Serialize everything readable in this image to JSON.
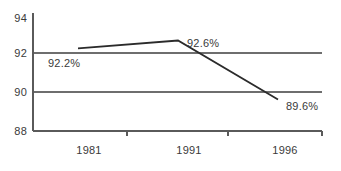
{
  "chart_data": {
    "type": "line",
    "title": "",
    "subtitle": "",
    "xlabel": "",
    "ylabel": "",
    "categories": [
      "1981",
      "1991",
      "1996"
    ],
    "series": [
      {
        "name": "",
        "values": [
          92.2,
          92.6,
          89.6
        ],
        "point_labels": [
          "92.2%",
          "92.6%",
          "89.6%"
        ],
        "color": "#2b2b2b"
      }
    ],
    "ylim": [
      88,
      94
    ],
    "yticks": [
      88,
      90,
      92,
      94
    ],
    "ytick_labels": [
      "88",
      "90",
      "92",
      "94"
    ],
    "gridlines": [
      90,
      92
    ],
    "grid": true,
    "legend": "none",
    "annotations": []
  },
  "axis": {
    "y_tick_88": "88",
    "y_tick_90": "90",
    "y_tick_92": "92",
    "y_tick_94": "94",
    "x_cat_1": "1981",
    "x_cat_2": "1991",
    "x_cat_3": "1996"
  },
  "labels": {
    "point_1": "92.2%",
    "point_2": "92.6%",
    "point_3": "89.6%"
  },
  "colors": {
    "series": "#2b2b2b",
    "grid": "#6e6e6e",
    "axis": "#5a5a5a",
    "text": "#3a3a3a",
    "background": "#ffffff"
  }
}
